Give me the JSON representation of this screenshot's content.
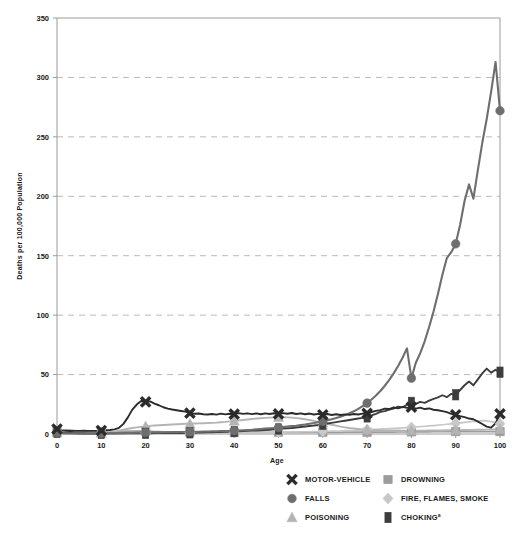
{
  "chart_data": {
    "type": "line",
    "title": "",
    "xlabel": "Age",
    "ylabel": "Deaths per 100,000 Population",
    "xlim": [
      0,
      100
    ],
    "ylim": [
      0,
      350
    ],
    "xticks": [
      0,
      10,
      20,
      30,
      40,
      50,
      60,
      70,
      80,
      90,
      100
    ],
    "yticks": [
      0,
      50,
      100,
      150,
      200,
      250,
      300,
      350
    ],
    "grid": "horizontal-dashed",
    "legend_position": "bottom",
    "marker_ages": [
      0,
      10,
      20,
      30,
      40,
      50,
      60,
      70,
      80,
      90,
      100
    ],
    "x": [
      0,
      1,
      2,
      3,
      4,
      5,
      6,
      7,
      8,
      9,
      10,
      11,
      12,
      13,
      14,
      15,
      16,
      17,
      18,
      19,
      20,
      21,
      22,
      23,
      24,
      25,
      26,
      27,
      28,
      29,
      30,
      31,
      32,
      33,
      34,
      35,
      36,
      37,
      38,
      39,
      40,
      41,
      42,
      43,
      44,
      45,
      46,
      47,
      48,
      49,
      50,
      51,
      52,
      53,
      54,
      55,
      56,
      57,
      58,
      59,
      60,
      61,
      62,
      63,
      64,
      65,
      66,
      67,
      68,
      69,
      70,
      71,
      72,
      73,
      74,
      75,
      76,
      77,
      78,
      79,
      80,
      81,
      82,
      83,
      84,
      85,
      86,
      87,
      88,
      89,
      90,
      91,
      92,
      93,
      94,
      95,
      96,
      97,
      98,
      99,
      100
    ],
    "series": [
      {
        "name": "MOTOR-VEHICLE",
        "marker": "x",
        "color": "#2b2b2b",
        "line_width": 1.9,
        "values": [
          4.2,
          3.0,
          2.6,
          2.5,
          2.6,
          2.6,
          2.7,
          2.6,
          2.6,
          2.7,
          3.0,
          3.2,
          3.4,
          3.9,
          5.2,
          8.5,
          14.0,
          20.5,
          24.8,
          27.8,
          27.0,
          27.4,
          25.6,
          24.2,
          22.5,
          21.4,
          20.6,
          20.0,
          19.4,
          18.8,
          17.6,
          17.1,
          17.2,
          16.6,
          16.4,
          16.8,
          16.3,
          17.2,
          16.5,
          17.0,
          16.7,
          17.6,
          16.9,
          17.4,
          16.7,
          17.3,
          16.6,
          17.4,
          16.8,
          17.5,
          16.9,
          17.6,
          17.0,
          17.7,
          16.8,
          17.4,
          16.6,
          17.2,
          16.4,
          16.9,
          16.2,
          16.8,
          16.0,
          16.6,
          16.0,
          16.5,
          16.1,
          16.8,
          16.4,
          17.2,
          17.4,
          18.5,
          19.4,
          20.1,
          21.3,
          21.0,
          22.4,
          21.6,
          22.8,
          22.0,
          22.6,
          21.4,
          22.2,
          21.0,
          21.5,
          20.4,
          20.0,
          19.2,
          18.4,
          17.0,
          16.2,
          15.0,
          14.2,
          13.0,
          12.4,
          10.4,
          8.4,
          6.2,
          5.4,
          9.0,
          17.0
        ]
      },
      {
        "name": "FALLS",
        "marker": "circle",
        "color": "#6e6e6e",
        "line_width": 2.1,
        "values": [
          1.0,
          0.6,
          0.5,
          0.4,
          0.4,
          0.3,
          0.3,
          0.3,
          0.3,
          0.3,
          0.4,
          0.4,
          0.4,
          0.5,
          0.6,
          0.7,
          0.8,
          0.9,
          1.1,
          1.2,
          1.3,
          1.3,
          1.4,
          1.4,
          1.5,
          1.5,
          1.6,
          1.6,
          1.7,
          1.7,
          1.8,
          1.8,
          1.9,
          2.0,
          2.1,
          2.2,
          2.3,
          2.4,
          2.5,
          2.6,
          2.8,
          3.0,
          3.2,
          3.4,
          3.6,
          3.9,
          4.2,
          4.5,
          4.8,
          5.1,
          5.4,
          5.8,
          6.2,
          6.6,
          7.0,
          7.5,
          8.0,
          8.6,
          9.2,
          9.9,
          10.6,
          11.5,
          12.4,
          13.4,
          14.6,
          15.9,
          17.4,
          19.1,
          21.1,
          23.4,
          26.0,
          29.0,
          32.4,
          36.2,
          40.6,
          45.5,
          51.0,
          57.2,
          64.2,
          72.0,
          47.0,
          60.0,
          68.0,
          78.0,
          90.0,
          103.0,
          118.0,
          134.0,
          148.0,
          153.0,
          160.0,
          176.0,
          196.0,
          210.0,
          198.0,
          222.0,
          245.0,
          265.0,
          288.0,
          313.0,
          272.0
        ]
      },
      {
        "name": "POISONING",
        "marker": "triangle",
        "color": "#b4b4b4",
        "line_width": 1.9,
        "values": [
          1.2,
          0.8,
          0.6,
          0.5,
          0.5,
          0.5,
          0.5,
          0.5,
          0.5,
          0.6,
          0.8,
          1.0,
          1.4,
          2.0,
          2.8,
          3.6,
          4.4,
          5.0,
          5.6,
          6.0,
          6.4,
          6.8,
          7.1,
          7.4,
          7.6,
          7.8,
          8.0,
          8.2,
          8.4,
          8.6,
          8.6,
          8.8,
          8.9,
          9.1,
          9.2,
          9.4,
          9.6,
          9.9,
          10.2,
          10.6,
          11.0,
          11.4,
          11.8,
          12.2,
          12.6,
          13.0,
          13.3,
          13.6,
          13.8,
          14.0,
          14.1,
          14.2,
          14.0,
          13.8,
          13.4,
          13.0,
          12.4,
          11.8,
          11.0,
          10.2,
          9.4,
          8.6,
          7.8,
          7.0,
          6.2,
          5.6,
          5.0,
          4.6,
          4.2,
          3.8,
          3.6,
          3.4,
          3.2,
          3.1,
          3.0,
          3.0,
          2.9,
          2.9,
          2.8,
          2.8,
          2.8,
          2.8,
          2.8,
          2.8,
          2.9,
          2.9,
          3.0,
          3.0,
          3.1,
          3.2,
          3.2,
          3.3,
          3.4,
          3.4,
          3.5,
          3.6,
          3.6,
          3.7,
          3.8,
          3.9,
          4.0
        ]
      },
      {
        "name": "DROWNING",
        "marker": "square",
        "color": "#9c9c9c",
        "line_width": 1.7,
        "values": [
          2.4,
          2.8,
          3.4,
          3.2,
          2.8,
          2.4,
          2.0,
          1.8,
          1.6,
          1.5,
          1.4,
          1.4,
          1.5,
          1.7,
          2.0,
          2.2,
          2.4,
          2.5,
          2.5,
          2.4,
          2.3,
          2.2,
          2.1,
          2.0,
          1.9,
          1.8,
          1.8,
          1.7,
          1.7,
          1.6,
          1.6,
          1.6,
          1.5,
          1.5,
          1.5,
          1.4,
          1.4,
          1.4,
          1.4,
          1.4,
          1.4,
          1.4,
          1.4,
          1.4,
          1.4,
          1.4,
          1.4,
          1.4,
          1.4,
          1.4,
          1.4,
          1.4,
          1.4,
          1.4,
          1.4,
          1.4,
          1.4,
          1.4,
          1.4,
          1.4,
          1.4,
          1.4,
          1.4,
          1.4,
          1.4,
          1.5,
          1.5,
          1.5,
          1.5,
          1.5,
          1.5,
          1.5,
          1.6,
          1.6,
          1.6,
          1.6,
          1.6,
          1.7,
          1.7,
          1.7,
          1.8,
          1.8,
          1.8,
          1.8,
          1.8,
          1.9,
          1.9,
          1.9,
          1.9,
          2.0,
          2.0,
          2.0,
          2.0,
          2.0,
          2.0,
          2.0,
          2.0,
          2.0,
          2.0,
          2.0,
          2.0
        ]
      },
      {
        "name": "FIRE, FLAMES, SMOKE",
        "marker": "diamond",
        "color": "#c8c8c8",
        "line_width": 1.7,
        "values": [
          1.6,
          2.2,
          2.6,
          2.4,
          2.0,
          1.8,
          1.6,
          1.4,
          1.3,
          1.2,
          1.1,
          1.0,
          1.0,
          0.9,
          0.9,
          0.9,
          0.9,
          0.9,
          0.9,
          0.9,
          0.9,
          0.9,
          0.9,
          0.9,
          0.9,
          1.0,
          1.0,
          1.0,
          1.0,
          1.0,
          1.0,
          1.0,
          1.0,
          1.0,
          1.1,
          1.1,
          1.1,
          1.1,
          1.2,
          1.2,
          1.2,
          1.2,
          1.3,
          1.3,
          1.3,
          1.4,
          1.4,
          1.4,
          1.5,
          1.5,
          1.6,
          1.6,
          1.7,
          1.7,
          1.8,
          1.8,
          1.9,
          1.9,
          2.0,
          2.1,
          2.2,
          2.3,
          2.4,
          2.5,
          2.6,
          2.8,
          2.9,
          3.0,
          3.2,
          3.4,
          3.6,
          3.8,
          4.0,
          4.2,
          4.4,
          4.6,
          4.8,
          5.0,
          5.2,
          5.4,
          5.6,
          5.9,
          6.2,
          6.5,
          6.8,
          7.1,
          7.4,
          7.8,
          8.2,
          8.6,
          9.0,
          9.4,
          9.8,
          10.2,
          10.6,
          11.0,
          11.2,
          11.0,
          10.4,
          9.6,
          8.6
        ]
      },
      {
        "name": "CHOKING",
        "marker": "rect",
        "color": "#3d3d3d",
        "line_width": 1.9,
        "values": [
          1.4,
          1.0,
          0.9,
          0.8,
          0.7,
          0.6,
          0.6,
          0.5,
          0.5,
          0.5,
          0.5,
          0.5,
          0.5,
          0.5,
          0.5,
          0.5,
          0.5,
          0.5,
          0.6,
          0.6,
          0.6,
          0.6,
          0.7,
          0.7,
          0.7,
          0.8,
          0.8,
          0.9,
          0.9,
          1.0,
          1.0,
          1.1,
          1.2,
          1.3,
          1.4,
          1.5,
          1.6,
          1.7,
          1.8,
          1.9,
          2.0,
          2.2,
          2.4,
          2.6,
          2.8,
          3.0,
          3.2,
          3.4,
          3.6,
          3.9,
          4.2,
          4.5,
          4.8,
          5.1,
          5.5,
          5.9,
          6.3,
          6.7,
          7.1,
          7.6,
          8.2,
          8.8,
          9.4,
          10.0,
          10.6,
          11.2,
          11.8,
          12.4,
          13.0,
          13.6,
          14.4,
          15.6,
          17.0,
          18.6,
          19.2,
          20.6,
          21.4,
          23.0,
          22.4,
          24.6,
          26.6,
          25.4,
          27.0,
          26.2,
          28.0,
          29.6,
          30.8,
          32.6,
          31.0,
          33.8,
          33.0,
          37.0,
          41.0,
          44.2,
          41.0,
          46.0,
          51.0,
          55.0,
          51.6,
          54.0,
          52.0
        ]
      }
    ]
  },
  "axis": {
    "xlabel": "Age",
    "ylabel": "Deaths per 100,000 Population"
  },
  "legend": {
    "items": [
      {
        "label": "MOTOR-VEHICLE",
        "marker": "x",
        "color": "#2b2b2b",
        "sup": ""
      },
      {
        "label": "DROWNING",
        "marker": "square",
        "color": "#9c9c9c",
        "sup": ""
      },
      {
        "label": "FALLS",
        "marker": "circle",
        "color": "#6e6e6e",
        "sup": ""
      },
      {
        "label": "FIRE, FLAMES, SMOKE",
        "marker": "diamond",
        "color": "#c8c8c8",
        "sup": ""
      },
      {
        "label": "POISONING",
        "marker": "triangle",
        "color": "#b4b4b4",
        "sup": ""
      },
      {
        "label": "CHOKING",
        "marker": "rect",
        "color": "#3d3d3d",
        "sup": "a"
      }
    ]
  },
  "colors": {
    "grid": "#b9b9b9",
    "axis": "#9a9a9a",
    "text": "#1a1a1a",
    "background": "#ffffff"
  }
}
